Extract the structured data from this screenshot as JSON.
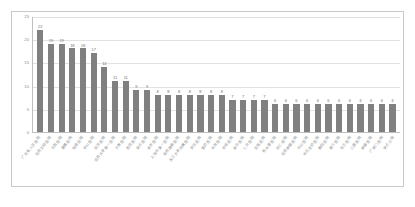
{
  "chart_data": {
    "type": "bar",
    "title": "",
    "subtitle": "",
    "xlabel": "",
    "ylabel": "",
    "ylim": [
      0,
      25
    ],
    "grid": true,
    "legend": false,
    "orientation": "vertical",
    "bar_color": "#808080",
    "axis_color": "#bfbfbf",
    "grid_color": "#e2e2e2",
    "label_color": "#8a8a8a",
    "yticks": [
      0,
      5,
      10,
      15,
      20,
      25
    ],
    "ytick_labels": [
      "0",
      "5",
      "10",
      "15",
      "20",
      "25"
    ],
    "categories": [
      "广东省人民医院",
      "北京协和医院",
      "华西医院",
      "湘雅医院",
      "瑞金医院",
      "中山医院",
      "同济医院",
      "北京大学第一医院",
      "齐鲁医院",
      "西京医院",
      "安贞医院",
      "阜外医院",
      "上海市第一医院",
      "南京鼓楼医院",
      "浙江大学附属医院",
      "天坛医院",
      "宣武医院",
      "长海医院",
      "中南医院",
      "新华医院",
      "仁济医院",
      "友谊医院",
      "积水潭医院",
      "同仁医院",
      "北京肿瘤医院",
      "华山医院",
      "中日友好医院",
      "朝阳医院",
      "第三医院",
      "东方医院",
      "儿童医院",
      "肿瘤医院",
      "广安门医院",
      "安贞分院"
    ],
    "values": [
      22,
      19,
      19,
      18,
      18,
      17,
      14,
      11,
      11,
      9,
      9,
      8,
      8,
      8,
      8,
      8,
      8,
      8,
      7,
      7,
      7,
      7,
      6,
      6,
      6,
      6,
      6,
      6,
      6,
      6,
      6,
      6,
      6,
      6
    ],
    "data_labels": [
      "22",
      "19",
      "19",
      "18",
      "18",
      "17",
      "14",
      "11",
      "11",
      "9",
      "9",
      "8",
      "8",
      "8",
      "8",
      "8",
      "8",
      "8",
      "7",
      "7",
      "7",
      "7",
      "6",
      "6",
      "6",
      "6",
      "6",
      "6",
      "6",
      "6",
      "6",
      "6",
      "6",
      "6"
    ]
  }
}
